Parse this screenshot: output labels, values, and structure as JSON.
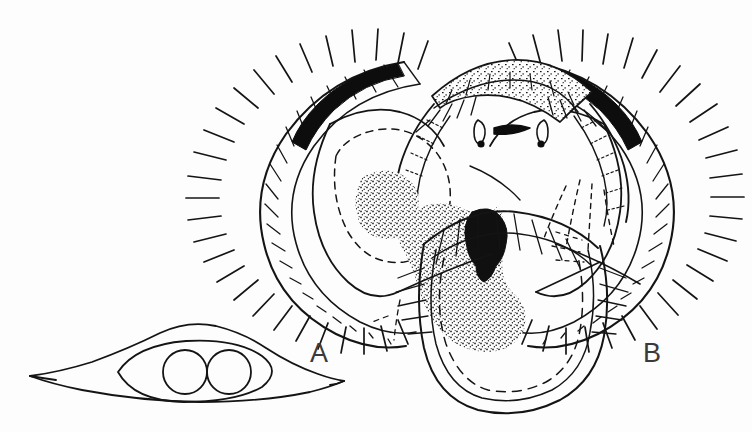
{
  "plate": {
    "kind": "scientific-line-drawing",
    "subject": "insect morphology plate, two figures",
    "background_color": "#fdfdfd",
    "ink_color": "#141414",
    "width": 752,
    "height": 432
  },
  "figures": [
    {
      "id": "A",
      "label": "A",
      "label_x": 310,
      "label_y": 338,
      "description": "lateral lens-shaped sclerite with tapered points and two circular bodies inside an inner oval",
      "elements": {
        "outer_outline": "spindle / lens shape with long drawn-out left and right tips",
        "inner_oval": "elongated oval enclosing the circles",
        "circle_left": {
          "cx": 185,
          "cy": 372,
          "r": 22
        },
        "circle_right": {
          "cx": 229,
          "cy": 372,
          "r": 22
        }
      }
    },
    {
      "id": "B",
      "label": "B",
      "label_x": 643,
      "label_y": 338,
      "description": "ventral view of paired setose lobes with black marginal bands, stippled patches, dashed internal outlines and a median sclerite bar with two papillae",
      "elements": {
        "left_lobe": "C-shaped lobe, fringe of radiating setae, black thickened band on dorso-lateral margin",
        "right_lobe": "mirrored C-shaped lobe, fringe of radiating setae, black thickened band on dorso-lateral margin",
        "median_arch": "stippled transverse band across the top centre",
        "black_bar": "short thick black median crescent bar",
        "papillae": [
          {
            "name": "left-papilla",
            "dot_x": 482,
            "dot_y": 142
          },
          {
            "name": "right-papilla",
            "dot_x": 541,
            "dot_y": 142
          }
        ],
        "dark_blob": "dense black irregular blob in centre of lower body",
        "stipple_patches": [
          "left-lobe stipple oval",
          "central large stipple mass",
          "median arch stipple"
        ],
        "lower_body": "broad rounded U-shaped shield with double outline and dashed inner contour"
      }
    }
  ]
}
